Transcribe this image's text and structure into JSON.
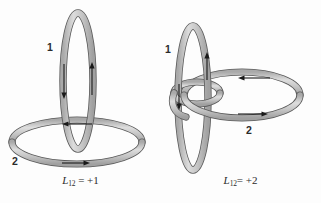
{
  "figure": {
    "background_color": "#fdfdfd",
    "tube_fill_color": "#c9c9c9",
    "tube_stroke_color": "#5a5a5a",
    "tube_highlight_color": "#e8e8e8",
    "arrow_color": "#1a1a1a",
    "label_color": "#2b2b2b"
  },
  "panels": [
    {
      "id": "panel-left",
      "loop1_label": "1",
      "loop2_label": "2",
      "caption": {
        "symbol": "L",
        "subscript": "12",
        "equals": "=",
        "value": "+1",
        "full": "L12 = +1"
      },
      "description": "Two simply linked rings, linking number plus one",
      "loop1_geometry": {
        "type": "vertical-ellipse",
        "cx": 78,
        "cy": 81,
        "rx": 15,
        "ry": 68
      },
      "loop2_geometry": {
        "type": "horizontal-ellipse",
        "cx": 77,
        "cy": 142,
        "rx": 65,
        "ry": 22
      },
      "arrows": [
        {
          "name": "loop1-left-arrow",
          "direction": "down"
        },
        {
          "name": "loop1-right-arrow",
          "direction": "up"
        },
        {
          "name": "loop2-back-arrow",
          "direction": "left"
        },
        {
          "name": "loop2-front-arrow",
          "direction": "right"
        }
      ]
    },
    {
      "id": "panel-right",
      "loop1_label": "1",
      "loop2_label": "2",
      "caption": {
        "symbol": "L",
        "subscript": "12",
        "equals": "=",
        "value": "+2",
        "full": "L12 = +2"
      },
      "description": "Ring 2 wound twice around ring 1, linking number plus two",
      "loop1_geometry": {
        "type": "vertical-ellipse",
        "cx": 33,
        "cy": 98,
        "rx": 15,
        "ry": 72
      },
      "loop2_geometry": {
        "type": "double-wound-coil",
        "cx": 82,
        "cy": 95,
        "rx": 58,
        "ry": 23,
        "inner_rx": 22,
        "inner_ry": 11
      },
      "arrows": [
        {
          "name": "loop1-left-arrow",
          "direction": "down"
        },
        {
          "name": "loop1-right-arrow",
          "direction": "up"
        },
        {
          "name": "loop2-back-arrow",
          "direction": "left"
        },
        {
          "name": "loop2-front-arrow",
          "direction": "right"
        }
      ]
    }
  ]
}
